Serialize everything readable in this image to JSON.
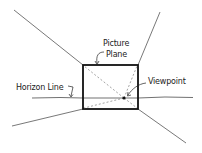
{
  "diagram": {
    "labels": {
      "picture_plane_line1": "Picture",
      "picture_plane_line2": "Plane",
      "horizon_line": "Horizon Line",
      "viewpoint": "Viewpoint"
    },
    "colors": {
      "ink": "#222222",
      "faint": "#555555",
      "background": "#ffffff"
    }
  }
}
